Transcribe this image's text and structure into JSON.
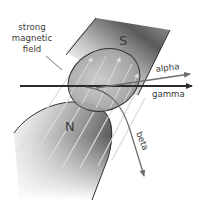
{
  "diagram": {
    "labels": {
      "field_line1": "strong",
      "field_line2": "magnetic",
      "field_line3": "field",
      "south_pole": "S",
      "north_pole": "N",
      "alpha": "alpha",
      "gamma": "gamma",
      "beta": "beta"
    },
    "colors": {
      "magnet_dark": "#4a4a4a",
      "magnet_light": "#f2f2f2",
      "gamma_arrow": "#2b2b2b",
      "alpha_arrow": "#6e6e6e",
      "beta_arrow": "#6e6e6e",
      "field_lines": "#d9d9d9",
      "outline": "#333333"
    }
  }
}
